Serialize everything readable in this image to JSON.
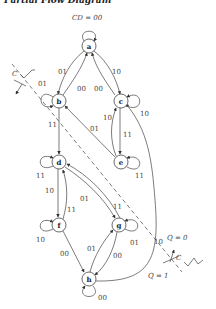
{
  "title": "Partial Flow Diagram",
  "header_label": "CD = 00",
  "q_labels": {
    "q0": "Q = 0",
    "q1": "Q = 1"
  },
  "clock_label": "C",
  "nodes": [
    {
      "id": "a",
      "label": "a"
    },
    {
      "id": "b",
      "label": "b"
    },
    {
      "id": "c",
      "label": "c"
    },
    {
      "id": "d",
      "label": "d"
    },
    {
      "id": "e",
      "label": "e"
    },
    {
      "id": "f",
      "label": "f"
    },
    {
      "id": "g",
      "label": "g"
    },
    {
      "id": "h",
      "label": "h"
    }
  ],
  "edges": [
    {
      "from": "a",
      "to": "a",
      "label": "00"
    },
    {
      "from": "a",
      "to": "b",
      "label": "01"
    },
    {
      "from": "a",
      "to": "c",
      "label": "10"
    },
    {
      "from": "b",
      "to": "a",
      "label": "00"
    },
    {
      "from": "c",
      "to": "a",
      "label": "00"
    },
    {
      "from": "b",
      "to": "b",
      "label": "01"
    },
    {
      "from": "c",
      "to": "c",
      "label": "10"
    },
    {
      "from": "b",
      "to": "d",
      "label": "11"
    },
    {
      "from": "e",
      "to": "b",
      "label": "01"
    },
    {
      "from": "c",
      "to": "e",
      "label": "11"
    },
    {
      "from": "e",
      "to": "c",
      "label": "10"
    },
    {
      "from": "e",
      "to": "e",
      "label": "11"
    },
    {
      "from": "d",
      "to": "d",
      "label": "11"
    },
    {
      "from": "d",
      "to": "f",
      "label": "10"
    },
    {
      "from": "f",
      "to": "d",
      "label": "11"
    },
    {
      "from": "d",
      "to": "g",
      "label": "01"
    },
    {
      "from": "g",
      "to": "d",
      "label": "11"
    },
    {
      "from": "f",
      "to": "f",
      "label": "10"
    },
    {
      "from": "g",
      "to": "g",
      "label": "01"
    },
    {
      "from": "f",
      "to": "h",
      "label": "00"
    },
    {
      "from": "h",
      "to": "g",
      "label": "01"
    },
    {
      "from": "g",
      "to": "h",
      "label": "00"
    },
    {
      "from": "h",
      "to": "h",
      "label": "00"
    },
    {
      "from": "h",
      "to": "c",
      "label": "10"
    }
  ],
  "edge_labels": {
    "aa": "CD = 00",
    "ab": "01",
    "ac": "10",
    "ba": "00",
    "ca": "00",
    "bb": "01",
    "cc": "10",
    "bd": "11",
    "eb": "01",
    "ce": "11",
    "ec": "10",
    "ee": "11",
    "dd": "11",
    "df": "10",
    "fd": "11",
    "dg": "01",
    "gd": "11",
    "ff": "10",
    "gg": "01",
    "fh": "00",
    "hg": "01",
    "gh": "00",
    "hh": "00",
    "hc": "10"
  }
}
